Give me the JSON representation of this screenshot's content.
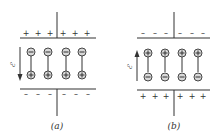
{
  "panels": [
    {
      "id": "a",
      "label": "(a)",
      "top_plate": {
        "charge": "positive",
        "signs": [
          "+",
          "+",
          "+",
          "+",
          "+",
          "+"
        ]
      },
      "bottom_plate": {
        "charge": "negative",
        "signs": [
          "–",
          "–",
          "–",
          "–",
          "–",
          "–"
        ]
      },
      "dipoles": [
        {
          "top": "⊖",
          "bottom": "⊕"
        },
        {
          "top": "⊖",
          "bottom": "⊕"
        },
        {
          "top": "⊖",
          "bottom": "⊕"
        },
        {
          "top": "⊖",
          "bottom": "⊕"
        }
      ],
      "field": {
        "symbol": "ℰ",
        "direction": "down"
      }
    },
    {
      "id": "b",
      "label": "(b)",
      "top_plate": {
        "charge": "negative",
        "signs": [
          "–",
          "–",
          "–",
          "–",
          "–",
          "–"
        ]
      },
      "bottom_plate": {
        "charge": "positive",
        "signs": [
          "+",
          "+",
          "+",
          "+",
          "+",
          "+"
        ]
      },
      "dipoles": [
        {
          "top": "⊕",
          "bottom": "⊖"
        },
        {
          "top": "⊕",
          "bottom": "⊖"
        },
        {
          "top": "⊕",
          "bottom": "⊖"
        },
        {
          "top": "⊕",
          "bottom": "⊖"
        }
      ],
      "field": {
        "symbol": "ℰ",
        "direction": "up"
      }
    }
  ],
  "colors": {
    "ink": "#333333",
    "circle_fill": "#d9d9d9",
    "background": "#ffffff"
  }
}
